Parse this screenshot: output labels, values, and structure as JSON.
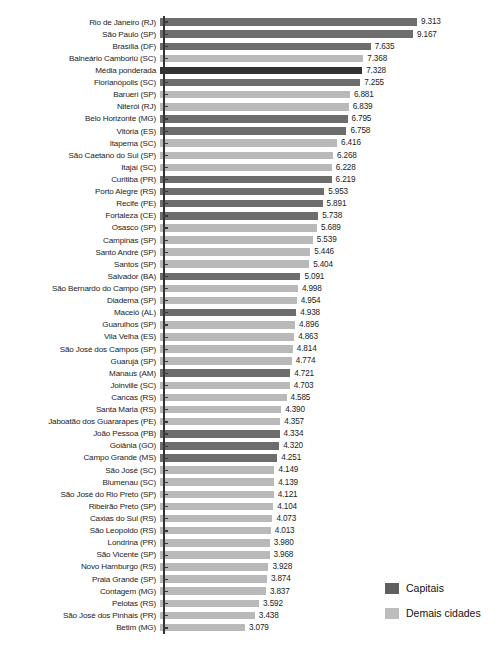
{
  "chart_data": {
    "type": "bar",
    "orientation": "horizontal",
    "title": "",
    "xlabel": "",
    "ylabel": "",
    "xlim": [
      0,
      9.313
    ],
    "grid": false,
    "value_format": "pt-BR thousands separator (period)",
    "legend": {
      "position": "bottom-right",
      "entries": [
        {
          "label": "Capitais",
          "color": "#6d6d6d",
          "key": "capital"
        },
        {
          "label": "Demais cidades",
          "color": "#b9b9b9",
          "key": "other"
        }
      ]
    },
    "series_note": "Highlighted weighted-average row rendered in near-black",
    "categories": [
      "Rio de Janeiro (RJ)",
      "São Paulo (SP)",
      "Brasília (DF)",
      "Balneário Camboriú (SC)",
      "Média ponderada",
      "Florianópolis (SC)",
      "Barueri (SP)",
      "Niterói (RJ)",
      "Belo Horizonte (MG)",
      "Vitória (ES)",
      "Itapema (SC)",
      "São Caetano do Sul (SP)",
      "Itajaí (SC)",
      "Curitiba (PR)",
      "Porto Alegre (RS)",
      "Recife (PE)",
      "Fortaleza (CE)",
      "Osasco (SP)",
      "Campinas (SP)",
      "Santo André (SP)",
      "Santos (SP)",
      "Salvador (BA)",
      "São Bernardo do Campo (SP)",
      "Diadema (SP)",
      "Maceió (AL)",
      "Guarulhos (SP)",
      "Vila Velha (ES)",
      "São José dos Campos (SP)",
      "Guarujá (SP)",
      "Manaus (AM)",
      "Joinville (SC)",
      "Cancas (RS)",
      "Santa Maria (RS)",
      "Jaboatão dos Guararapes (PE)",
      "João Pessoa (PB)",
      "Goiânia (GO)",
      "Campo Grande (MS)",
      "São José (SC)",
      "Blumenau (SC)",
      "São José do Rio Preto (SP)",
      "Ribeirão Preto (SP)",
      "Caxias do Sul (RS)",
      "São Leopoldo (RS)",
      "Londrina (PR)",
      "São Vicente (SP)",
      "Novo Hamburgo (RS)",
      "Praia Grande (SP)",
      "Contagem (MG)",
      "Pelotas (RS)",
      "São José dos Pinhais (PR)",
      "Betim (MG)"
    ],
    "values": [
      9.313,
      9.167,
      7.635,
      7.368,
      7.328,
      7.255,
      6.881,
      6.839,
      6.795,
      6.758,
      6.416,
      6.268,
      6.228,
      6.219,
      5.953,
      5.891,
      5.738,
      5.689,
      5.539,
      5.446,
      5.404,
      5.091,
      4.998,
      4.954,
      4.938,
      4.896,
      4.863,
      4.814,
      4.774,
      4.721,
      4.703,
      4.585,
      4.39,
      4.357,
      4.334,
      4.32,
      4.251,
      4.149,
      4.139,
      4.121,
      4.104,
      4.073,
      4.013,
      3.98,
      3.968,
      3.928,
      3.874,
      3.837,
      3.592,
      3.438,
      3.079
    ],
    "value_labels": [
      "9.313",
      "9.167",
      "7.635",
      "7.368",
      "7.328",
      "7.255",
      "6.881",
      "6.839",
      "6.795",
      "6.758",
      "6.416",
      "6.268",
      "6.228",
      "6.219",
      "5.953",
      "5.891",
      "5.738",
      "5.689",
      "5.539",
      "5.446",
      "5.404",
      "5.091",
      "4.998",
      "4.954",
      "4.938",
      "4.896",
      "4.863",
      "4.814",
      "4.774",
      "4.721",
      "4.703",
      "4.585",
      "4.390",
      "4.357",
      "4.334",
      "4.320",
      "4.251",
      "4.149",
      "4.139",
      "4.121",
      "4.104",
      "4.073",
      "4.013",
      "3.980",
      "3.968",
      "3.928",
      "3.874",
      "3.837",
      "3.592",
      "3.438",
      "3.079"
    ],
    "groups": [
      "capital",
      "capital",
      "capital",
      "other",
      "mean",
      "capital",
      "other",
      "other",
      "capital",
      "capital",
      "other",
      "other",
      "other",
      "capital",
      "capital",
      "capital",
      "capital",
      "other",
      "other",
      "other",
      "other",
      "capital",
      "other",
      "other",
      "capital",
      "other",
      "other",
      "other",
      "other",
      "capital",
      "other",
      "other",
      "other",
      "other",
      "capital",
      "capital",
      "capital",
      "other",
      "other",
      "other",
      "other",
      "other",
      "other",
      "other",
      "other",
      "other",
      "other",
      "other",
      "other",
      "other",
      "other"
    ]
  },
  "caption": ""
}
